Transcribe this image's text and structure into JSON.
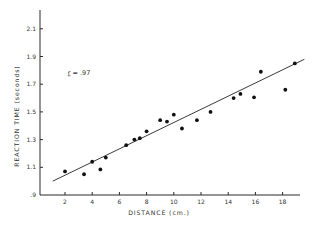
{
  "chart_data": {
    "type": "scatter",
    "title": "",
    "xlabel": "DISTANCE (cm.)",
    "ylabel": "REACTION TIME (seconds)",
    "xlim": [
      0,
      19
    ],
    "ylim": [
      0.9,
      2.25
    ],
    "x_ticks": [
      2,
      4,
      6,
      8,
      10,
      12,
      14,
      16,
      18
    ],
    "x_tick_labels": [
      "2",
      "4",
      "6",
      "8",
      "10",
      "12",
      "14",
      "16",
      "18"
    ],
    "y_ticks": [
      0.9,
      1.1,
      1.3,
      1.5,
      1.7,
      1.9,
      2.1
    ],
    "y_tick_labels": [
      ".9",
      "1.1",
      "1.3",
      "1.5",
      "1.7",
      "1.9",
      "2.1"
    ],
    "grid": false,
    "legend": null,
    "annotations": [
      {
        "text_var": "r",
        "text_rest": " = .97",
        "x": 2.2,
        "y": 1.77
      }
    ],
    "series": [
      {
        "name": "observations",
        "x": [
          2.0,
          3.4,
          4.0,
          4.6,
          5.0,
          6.5,
          7.1,
          7.5,
          8.0,
          9.0,
          9.5,
          10.0,
          10.6,
          11.7,
          12.7,
          14.4,
          14.9,
          15.9,
          16.4,
          18.2,
          18.9
        ],
        "y": [
          1.07,
          1.05,
          1.14,
          1.085,
          1.17,
          1.26,
          1.3,
          1.31,
          1.36,
          1.44,
          1.43,
          1.48,
          1.38,
          1.44,
          1.5,
          1.6,
          1.63,
          1.605,
          1.79,
          1.66,
          1.85
        ]
      }
    ],
    "regression_line": {
      "x": [
        1.1,
        19.6
      ],
      "y": [
        1.0,
        1.88
      ]
    }
  }
}
